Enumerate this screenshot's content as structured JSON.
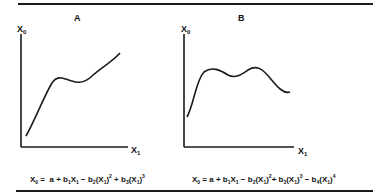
{
  "panels": [
    {
      "id": "A",
      "title": "A",
      "y_axis_label": "X",
      "y_axis_sub": "0",
      "x_axis_label": "X",
      "x_axis_sub": "1",
      "curve_shape": "cubic: rising, local max, local min, rising",
      "equation": {
        "lhs": "X",
        "lhs_sub": "0",
        "text": "X0 = a+b1X1−b2(X1)^2+b3(X1)^3"
      }
    },
    {
      "id": "B",
      "title": "B",
      "y_axis_label": "X",
      "y_axis_sub": "0",
      "x_axis_label": "X",
      "x_axis_sub": "1",
      "curve_shape": "quartic: rising, max, min, max, falling",
      "equation": {
        "lhs": "X",
        "lhs_sub": "0",
        "text": "X0 = a+b1X1−b2(X1)^2+b3(X1)^3−b4(X1)^4"
      }
    }
  ],
  "colors": {
    "line": "#1a1a1a",
    "background": "#ffffff"
  }
}
